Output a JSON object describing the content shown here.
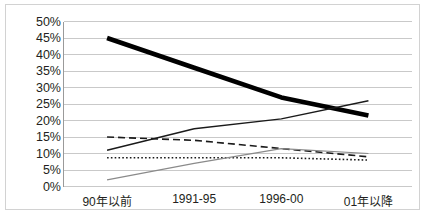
{
  "chart_data": {
    "type": "line",
    "title": "",
    "subtitle": "",
    "xlabel": "",
    "ylabel": "",
    "categories": [
      "90年以前",
      "1991-95",
      "1996-00",
      "01年以降"
    ],
    "ylim": [
      0,
      50
    ],
    "ytick_labels": [
      "0%",
      "5%",
      "10%",
      "15%",
      "20%",
      "25%",
      "30%",
      "35%",
      "40%",
      "45%",
      "50%"
    ],
    "ytick_values": [
      0,
      5,
      10,
      15,
      20,
      25,
      30,
      35,
      40,
      45,
      50
    ],
    "grid": "horizontal",
    "legend": "none",
    "annotations": [],
    "series": [
      {
        "name": "series-1-thick-solid",
        "style": "thick-solid-black",
        "color": "#000000",
        "width": 4.6,
        "dash": "none",
        "values": [
          45.0,
          36.0,
          27.0,
          21.5
        ]
      },
      {
        "name": "series-2-thin-solid-rising",
        "style": "thin-solid-black",
        "color": "#1a1a1a",
        "width": 1.4,
        "dash": "none",
        "values": [
          11.0,
          17.5,
          20.5,
          26.0
        ]
      },
      {
        "name": "series-3-dashed",
        "style": "dashed-black",
        "color": "#1a1a1a",
        "width": 1.6,
        "dash": "7,4",
        "values": [
          15.0,
          14.0,
          11.5,
          9.0
        ]
      },
      {
        "name": "series-4-dotted",
        "style": "dotted-black",
        "color": "#1a1a1a",
        "width": 1.6,
        "dash": "1.6,2.2",
        "values": [
          8.7,
          8.7,
          8.7,
          8.0
        ]
      },
      {
        "name": "series-5-thin-gray",
        "style": "thin-solid-gray",
        "color": "#8a8a8a",
        "width": 1.2,
        "dash": "none",
        "values": [
          2.0,
          7.0,
          11.5,
          10.0
        ]
      }
    ]
  },
  "axes": {
    "y_axis_line_color": "#9a9a9a",
    "gridline_color": "#c9c9c9",
    "border_color": "#d2d2d2",
    "background": "#ffffff"
  }
}
